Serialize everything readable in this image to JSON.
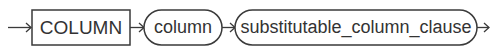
{
  "diagram": {
    "type": "railroad-syntax-diagram",
    "nodes": [
      {
        "kind": "keyword",
        "shape": "rectangle",
        "label": "COLUMN"
      },
      {
        "kind": "non-terminal",
        "shape": "rounded",
        "label": "column"
      },
      {
        "kind": "non-terminal",
        "shape": "rounded",
        "label": "substitutable_column_clause"
      }
    ],
    "colors": {
      "stroke": "#3a3a3a",
      "text": "#333333",
      "background": "#ffffff"
    }
  }
}
